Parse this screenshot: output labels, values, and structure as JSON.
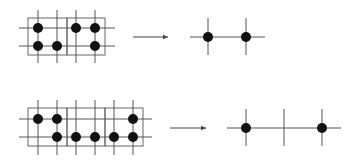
{
  "diagram": {
    "type": "grid-coarsening",
    "colors": {
      "line": "#555555",
      "box": "#666666",
      "dot": "#111111",
      "arrow": "#444444",
      "background": "#ffffff"
    },
    "rows": [
      {
        "label": "row-1",
        "left_grid": {
          "boxes": [
            {
              "x": 28,
              "y": 18,
              "w": 39,
              "h": 37
            },
            {
              "x": 67,
              "y": 18,
              "w": 38,
              "h": 37
            }
          ],
          "vlines": [
            38,
            57,
            76,
            95
          ],
          "vline_y": [
            10,
            63
          ],
          "hlines": [
            28,
            46
          ],
          "hline_x": [
            19,
            115
          ],
          "dots": [
            [
              38,
              28
            ],
            [
              38,
              46
            ],
            [
              57,
              46
            ],
            [
              76,
              28
            ],
            [
              95,
              28
            ],
            [
              95,
              46
            ]
          ]
        },
        "arrow": {
          "x1": 133,
          "x2": 170,
          "y": 37
        },
        "right_grid": {
          "hline": {
            "x1": 190,
            "x2": 265,
            "y": 37
          },
          "vlines": [
            208,
            246
          ],
          "vline_y": [
            18,
            55
          ],
          "dots": [
            [
              208,
              37
            ],
            [
              246,
              37
            ]
          ]
        }
      },
      {
        "label": "row-2",
        "left_grid": {
          "boxes": [
            {
              "x": 28,
              "y": 108,
              "w": 39,
              "h": 38
            },
            {
              "x": 67,
              "y": 108,
              "w": 38,
              "h": 38
            },
            {
              "x": 105,
              "y": 108,
              "w": 38,
              "h": 38
            }
          ],
          "vlines": [
            38,
            57,
            76,
            95,
            114,
            133
          ],
          "vline_y": [
            100,
            155
          ],
          "hlines": [
            119,
            137
          ],
          "hline_x": [
            19,
            152
          ],
          "dots": [
            [
              38,
              119
            ],
            [
              57,
              119
            ],
            [
              57,
              137
            ],
            [
              76,
              137
            ],
            [
              95,
              137
            ],
            [
              114,
              137
            ],
            [
              133,
              119
            ],
            [
              133,
              137
            ]
          ]
        },
        "arrow": {
          "x1": 170,
          "x2": 208,
          "y": 128
        },
        "right_grid": {
          "hline": {
            "x1": 227,
            "x2": 341,
            "y": 128
          },
          "vlines": [
            246,
            284,
            322
          ],
          "vline_y": [
            109,
            146
          ],
          "dots": [
            [
              246,
              128
            ],
            [
              322,
              128
            ]
          ]
        }
      }
    ]
  }
}
